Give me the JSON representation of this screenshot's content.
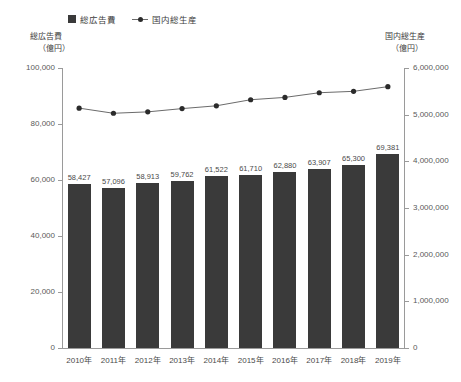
{
  "chart_data": {
    "type": "bar",
    "title": "",
    "categories": [
      "2010年",
      "2011年",
      "2012年",
      "2013年",
      "2014年",
      "2015年",
      "2016年",
      "2017年",
      "2018年",
      "2019年"
    ],
    "series": [
      {
        "name": "総広告費",
        "kind": "bar",
        "axis": "left",
        "unit": "億円",
        "values": [
          58427,
          57096,
          58913,
          59762,
          61522,
          61710,
          62880,
          63907,
          65300,
          69381
        ],
        "labels": [
          "58,427",
          "57,096",
          "58,913",
          "59,762",
          "61,522",
          "61,710",
          "62,880",
          "63,907",
          "65,300",
          "69,381"
        ],
        "color": "#3a3a3a"
      },
      {
        "name": "国内総生産",
        "kind": "line",
        "axis": "right",
        "unit": "億円",
        "values": [
          5140000,
          5030000,
          5060000,
          5130000,
          5190000,
          5320000,
          5370000,
          5470000,
          5500000,
          5600000
        ],
        "color": "#6b6b6b",
        "marker_color": "#2b2b2b"
      }
    ],
    "xlabel": "",
    "ylabel": "総広告費",
    "y2label": "国内総生産",
    "ylim": [
      0,
      100000
    ],
    "y2lim": [
      0,
      6000000
    ],
    "yticks": [
      0,
      20000,
      40000,
      60000,
      80000,
      100000
    ],
    "ytick_labels": [
      "0",
      "20,000",
      "40,000",
      "60,000",
      "80,000",
      "100,000"
    ],
    "y2ticks": [
      0,
      1000000,
      2000000,
      3000000,
      4000000,
      5000000,
      6000000
    ],
    "y2tick_labels": [
      "0",
      "1,000,000",
      "2,000,000",
      "3,000,000",
      "4,000,000",
      "5,000,000",
      "6,000,000"
    ],
    "grid": false,
    "legend_position": "top-left"
  },
  "legend": {
    "items": [
      {
        "label": "総広告費",
        "marker": "square-swatch-icon"
      },
      {
        "label": "国内総生産",
        "marker": "line-marker-icon"
      }
    ]
  },
  "axis_captions": {
    "left_title": "総広告費",
    "left_unit": "（億円）",
    "right_title": "国内総生産",
    "right_unit": "（億円）"
  }
}
